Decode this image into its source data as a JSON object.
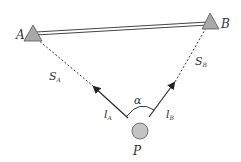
{
  "diagram": {
    "colors": {
      "stroke": "#333333",
      "fill_point": "#b8b8b8",
      "background": "#ffffff"
    },
    "points": {
      "A": {
        "label": "A",
        "shape": "triangle"
      },
      "B": {
        "label": "B",
        "shape": "triangle"
      },
      "P": {
        "label": "P",
        "shape": "circle"
      }
    },
    "edges": {
      "AB": {
        "style": "double-line"
      },
      "S_A": {
        "label": "S",
        "sub": "A",
        "style": "dashed"
      },
      "S_B": {
        "label": "S",
        "sub": "B",
        "style": "dashed"
      },
      "l_A": {
        "label": "l",
        "sub": "A",
        "style": "arrow"
      },
      "l_B": {
        "label": "l",
        "sub": "B",
        "style": "arrow"
      }
    },
    "angle": {
      "label": "α"
    }
  }
}
